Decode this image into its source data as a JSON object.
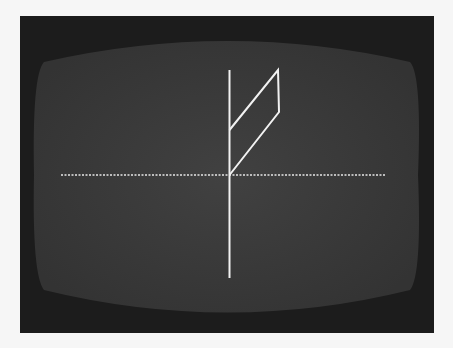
{
  "scene": {
    "description": "Photograph of a CRT display screen showing a simple vector line drawing",
    "colors": {
      "background": "#f6f6f6",
      "bezel": "#1c1c1c",
      "screen": "#3a3a3a",
      "trace": "#f2f2f2"
    },
    "drawing": {
      "vertical_axis": {
        "x": 229,
        "y1": 70,
        "y2": 278
      },
      "horizontal_axis": {
        "y": 175,
        "x1": 61,
        "x2": 386,
        "style": "dotted"
      },
      "parallelogram": {
        "points": [
          [
            229,
            130
          ],
          [
            278,
            70
          ],
          [
            279,
            112
          ],
          [
            229,
            175
          ]
        ]
      }
    }
  }
}
